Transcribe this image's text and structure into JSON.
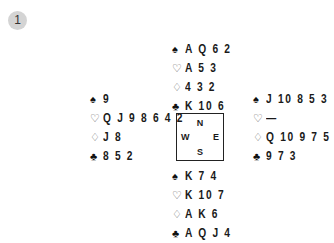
{
  "problem_number": "1",
  "suits": {
    "spades": "♠",
    "hearts": "♡",
    "diamonds": "♢",
    "clubs": "♣"
  },
  "hands": {
    "north": {
      "spades": "A Q 6 2",
      "hearts": "A 5 3",
      "diamonds": "4 3 2",
      "clubs": "K 10 6"
    },
    "west": {
      "spades": "9",
      "hearts": "Q J 9 8 6 4 2",
      "diamonds": "J 8",
      "clubs": "8 5 2"
    },
    "east": {
      "spades": "J 10 8 5 3",
      "hearts": "—",
      "diamonds": "Q 10 9 7 5",
      "clubs": "9 7 3"
    },
    "south": {
      "spades": "K 7 4",
      "hearts": "K 10 7",
      "diamonds": "A K 6",
      "clubs": "A Q J 4"
    }
  },
  "compass": {
    "n": "N",
    "s": "S",
    "w": "W",
    "e": "E"
  }
}
